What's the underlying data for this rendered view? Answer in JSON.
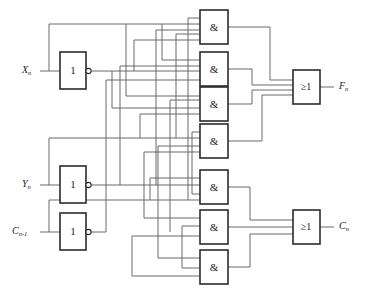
{
  "diagram": {
    "type": "logic-circuit-diagram",
    "line_color": "#5a5a5a",
    "box_stroke_color": "#2b2b2b",
    "background_color": "#ffffff"
  },
  "inputs": [
    {
      "id": "xn",
      "label": "X",
      "subscript": "n",
      "x": 24,
      "y": 71
    },
    {
      "id": "yn",
      "label": "Y",
      "subscript": "n",
      "x": 24,
      "y": 185
    },
    {
      "id": "cn1",
      "label": "C",
      "subscript": "n-1",
      "x": 14,
      "y": 232
    }
  ],
  "outputs": [
    {
      "id": "fn",
      "label": "F",
      "subscript": "n",
      "x": 340,
      "y": 87
    },
    {
      "id": "cn",
      "label": "C",
      "subscript": "n",
      "x": 340,
      "y": 227
    }
  ],
  "inverters": [
    {
      "id": "inv-xn",
      "symbol": "1",
      "x": 60,
      "y": 52,
      "w": 26,
      "h": 37
    },
    {
      "id": "inv-yn",
      "symbol": "1",
      "x": 60,
      "y": 166,
      "w": 26,
      "h": 37
    },
    {
      "id": "inv-cn1",
      "symbol": "1",
      "x": 60,
      "y": 213,
      "w": 26,
      "h": 37
    }
  ],
  "and_gates": [
    {
      "id": "and-1",
      "symbol": "&",
      "x": 200,
      "y": 10,
      "w": 28,
      "h": 34
    },
    {
      "id": "and-2",
      "symbol": "&",
      "x": 200,
      "y": 52,
      "w": 28,
      "h": 34
    },
    {
      "id": "and-3",
      "symbol": "&",
      "x": 200,
      "y": 87,
      "w": 28,
      "h": 34
    },
    {
      "id": "and-4",
      "symbol": "&",
      "x": 200,
      "y": 124,
      "w": 28,
      "h": 34
    },
    {
      "id": "and-5",
      "symbol": "&",
      "x": 200,
      "y": 170,
      "w": 28,
      "h": 34
    },
    {
      "id": "and-6",
      "symbol": "&",
      "x": 200,
      "y": 210,
      "w": 28,
      "h": 34
    },
    {
      "id": "and-7",
      "symbol": "&",
      "x": 200,
      "y": 250,
      "w": 28,
      "h": 34
    }
  ],
  "or_gates": [
    {
      "id": "or-sum",
      "symbol": "≥1",
      "x": 293,
      "y": 70,
      "w": 27,
      "h": 34
    },
    {
      "id": "or-carry",
      "symbol": "≥1",
      "x": 293,
      "y": 210,
      "w": 27,
      "h": 34
    }
  ],
  "legend": {
    "and_symbol": "&",
    "or_symbol": "≥1",
    "inverter_symbol": "1"
  }
}
